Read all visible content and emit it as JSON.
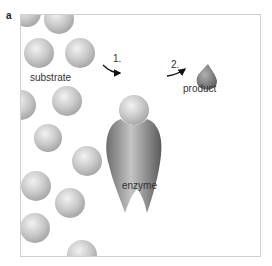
{
  "figure": {
    "panel_label": "a",
    "labels": {
      "substrate": "substrate",
      "enzyme": "enzyme",
      "product": "product",
      "step1": "1.",
      "step2": "2."
    },
    "colors": {
      "substrate": "#c8c8c8",
      "enzyme": "#8a8a8a",
      "product": "#7a7a7a",
      "frame": "#cfcfcf"
    }
  }
}
